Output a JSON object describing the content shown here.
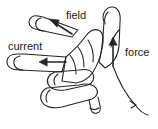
{
  "diagram": {
    "background_color": "#ffffff",
    "line_color": "#262626",
    "text_color": "#1a1a1a",
    "labels": {
      "field": "field",
      "current": "current",
      "force": "force"
    },
    "arrows": [
      {
        "name": "field-arrow",
        "direction": "up-left",
        "from": [
          72,
          33
        ],
        "to": [
          50,
          20
        ]
      },
      {
        "name": "current-arrow",
        "direction": "left",
        "from": [
          66,
          62
        ],
        "to": [
          40,
          62
        ]
      },
      {
        "name": "force-arrow",
        "direction": "up",
        "from": [
          113,
          64
        ],
        "to": [
          113,
          38
        ]
      }
    ]
  }
}
